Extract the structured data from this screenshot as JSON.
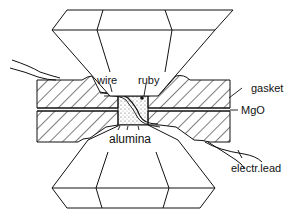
{
  "figure": {
    "type": "diamond anvil cell cross-section",
    "labels": {
      "wire": "wire",
      "ruby": "ruby",
      "gasket": "gasket",
      "mgo": "MgO",
      "alumina": "alumina",
      "electr_lead": "electr.lead"
    },
    "colors": {
      "line": "#111111",
      "background": "#ffffff",
      "sample_fill": "#f2f2f2"
    }
  }
}
